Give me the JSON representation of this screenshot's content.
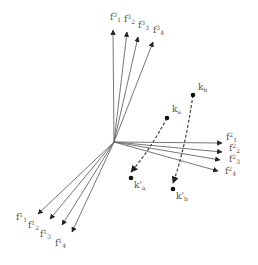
{
  "diagram": {
    "colors": {
      "line": "#666666",
      "arrow": "#222222",
      "dashed": "#444444",
      "label": "#555555"
    },
    "groups": [
      {
        "name": "f3",
        "labels": [
          {
            "base": "f",
            "sup": "3",
            "sub": "1"
          },
          {
            "base": "f",
            "sup": "3",
            "sub": "2"
          },
          {
            "base": "f",
            "sup": "3",
            "sub": "3"
          },
          {
            "base": "f",
            "sup": "3",
            "sub": "4"
          }
        ]
      },
      {
        "name": "f2",
        "labels": [
          {
            "base": "f",
            "sup": "2",
            "sub": "1"
          },
          {
            "base": "f",
            "sup": "2",
            "sub": "2"
          },
          {
            "base": "f",
            "sup": "2",
            "sub": "3"
          },
          {
            "base": "f",
            "sup": "2",
            "sub": "4"
          }
        ]
      },
      {
        "name": "f1",
        "labels": [
          {
            "base": "f",
            "sup": "1",
            "sub": "1"
          },
          {
            "base": "f",
            "sup": "1",
            "sub": "2"
          },
          {
            "base": "f",
            "sup": "1",
            "sub": "3"
          },
          {
            "base": "f",
            "sup": "1",
            "sub": "4"
          }
        ]
      }
    ],
    "points": [
      {
        "id": "ka",
        "label": "k",
        "sub": "a"
      },
      {
        "id": "kb",
        "label": "k",
        "sub": "b"
      },
      {
        "id": "ka_prime",
        "label": "k'",
        "sub": "a"
      },
      {
        "id": "kb_prime",
        "label": "k'",
        "sub": "b"
      }
    ]
  }
}
